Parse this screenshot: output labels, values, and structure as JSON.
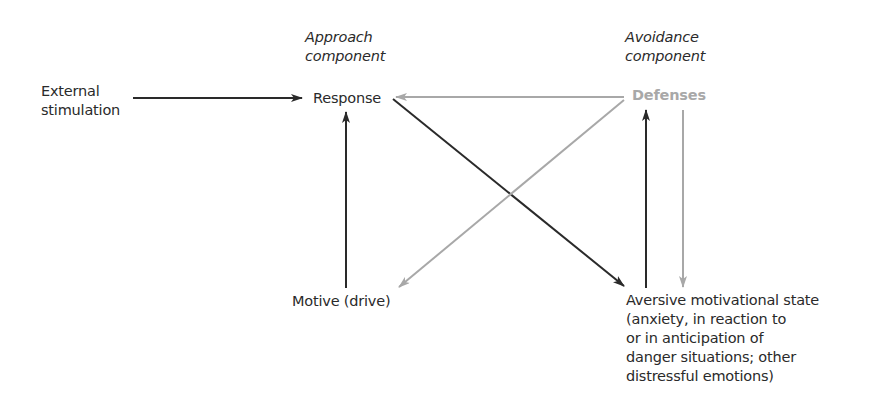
{
  "headers": {
    "approach": [
      "Approach",
      "component"
    ],
    "avoidance": [
      "Avoidance",
      "component"
    ]
  },
  "nodes": {
    "external_stimulation": [
      "External",
      "stimulation"
    ],
    "response": "Response",
    "defenses": "Defenses",
    "motive": "Motive (drive)",
    "aversive_state": [
      "Aversive motivational state",
      "(anxiety, in reaction to",
      "or in anticipation of",
      "danger situations; other",
      "distressful emotions)"
    ]
  },
  "colors": {
    "dark_arrow": "#2a2a2a",
    "gray_arrow": "#a8a8a8",
    "text": "#2a2a2a",
    "defenses_text": "#a8a8a8"
  },
  "edges": [
    {
      "from": "External stimulation",
      "to": "Response",
      "style": "dark"
    },
    {
      "from": "Motive (drive)",
      "to": "Response",
      "style": "dark"
    },
    {
      "from": "Response",
      "to": "Aversive motivational state",
      "style": "dark"
    },
    {
      "from": "Aversive motivational state",
      "to": "Defenses",
      "style": "dark"
    },
    {
      "from": "Defenses",
      "to": "Response",
      "style": "gray"
    },
    {
      "from": "Defenses",
      "to": "Motive (drive)",
      "style": "gray"
    },
    {
      "from": "Defenses",
      "to": "Aversive motivational state",
      "style": "gray"
    }
  ]
}
